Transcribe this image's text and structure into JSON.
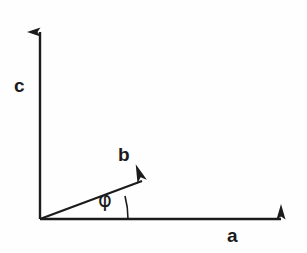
{
  "figure": {
    "background_color": "#fefefe",
    "stroke_color": "#1b1b1b",
    "width": 307,
    "height": 253
  },
  "labels": {
    "vertical_axis": "c",
    "horizontal_axis": "a",
    "vector": "b",
    "angle": "φ"
  },
  "geometry": {
    "origin": {
      "x": 40,
      "y": 219
    },
    "vertical_axis_tip": {
      "x": 40,
      "y": 18
    },
    "horizontal_axis_tip": {
      "x": 296,
      "y": 219
    },
    "vector_b_tip": {
      "x": 159,
      "y": 168
    },
    "vector_b_angle_degrees": 15,
    "arc_radius": 88,
    "line_width": 2
  },
  "icons": {
    "vertical_axis": "arrow-up-icon",
    "horizontal_axis": "arrow-right-icon",
    "vector": "arrow-vector-icon",
    "angle_arc": "arc-icon"
  }
}
